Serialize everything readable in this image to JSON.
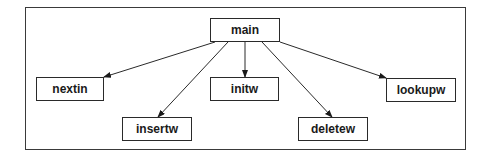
{
  "diagram": {
    "type": "call-graph",
    "root": {
      "id": "main",
      "label": "main"
    },
    "children": [
      {
        "id": "nextin",
        "label": "nextin"
      },
      {
        "id": "insertw",
        "label": "insertw"
      },
      {
        "id": "initw",
        "label": "initw"
      },
      {
        "id": "deletew",
        "label": "deletew"
      },
      {
        "id": "lookupw",
        "label": "lookupw"
      }
    ],
    "edges": [
      {
        "from": "main",
        "to": "nextin"
      },
      {
        "from": "main",
        "to": "insertw"
      },
      {
        "from": "main",
        "to": "initw"
      },
      {
        "from": "main",
        "to": "deletew"
      },
      {
        "from": "main",
        "to": "lookupw"
      }
    ],
    "colors": {
      "stroke": "#2a2a2a",
      "background": "#ffffff",
      "text": "#1a1a1a"
    }
  }
}
